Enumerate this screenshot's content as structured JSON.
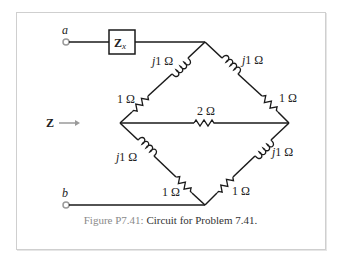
{
  "figure": {
    "caption_label": "Figure P7.41:",
    "caption_text": "Circuit for Problem 7.41."
  },
  "terminals": {
    "a": "a",
    "b": "b"
  },
  "impedance_box": {
    "symbol": "Z",
    "subscript": "x"
  },
  "input_arrow": {
    "label": "Z",
    "arrow": "→"
  },
  "components": {
    "upper_left_inductor": "j1 Ω",
    "upper_left_resistor": "1 Ω",
    "upper_right_inductor": "j1 Ω",
    "upper_right_resistor": "1 Ω",
    "middle_resistor": "2 Ω",
    "lower_left_inductor": "j1 Ω",
    "lower_left_resistor": "1 Ω",
    "lower_right_inductor": "j1 Ω",
    "lower_right_resistor": "1 Ω"
  },
  "colors": {
    "wire": "#1a1a1a",
    "terminal": "#9a9a9a",
    "caption_label": "#8a8a8a",
    "frame": "#cfcfcf"
  }
}
